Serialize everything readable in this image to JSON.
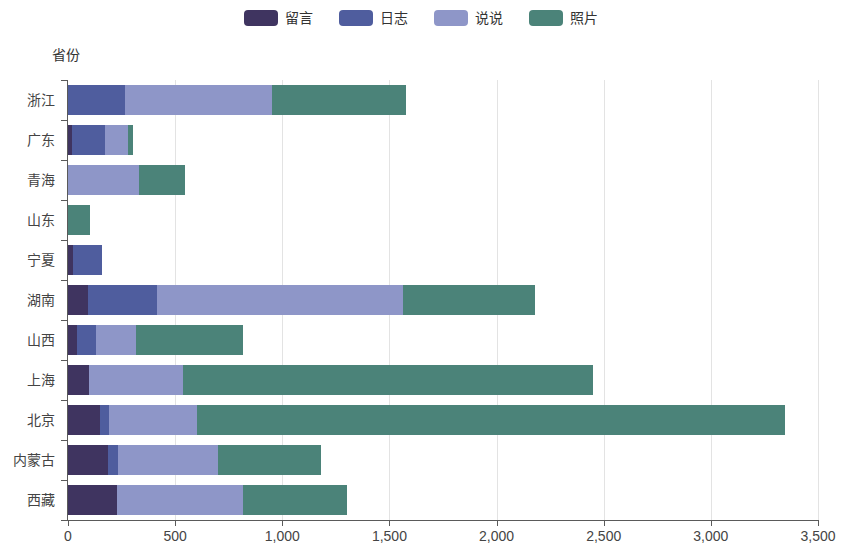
{
  "legend": {
    "position": "top-center",
    "items": [
      {
        "label": "留言",
        "color": "#3f3460",
        "key": "liuyan"
      },
      {
        "label": "日志",
        "color": "#4f5d9e",
        "key": "rizhi"
      },
      {
        "label": "说说",
        "color": "#8e96c8",
        "key": "shuoshuo"
      },
      {
        "label": "照片",
        "color": "#4b8379",
        "key": "zhaopian"
      }
    ]
  },
  "axis_title": "省份",
  "chart_data": {
    "type": "bar",
    "orientation": "horizontal",
    "stacked": true,
    "title": "",
    "subtitle": "",
    "xlabel": "",
    "ylabel": "省份",
    "xlim": [
      0,
      3500
    ],
    "ylim": null,
    "grid": true,
    "legend_position": "top-center",
    "xticks": [
      0,
      500,
      1000,
      1500,
      2000,
      2500,
      3000,
      3500
    ],
    "xticklabels": [
      "0",
      "500",
      "1,000",
      "1,500",
      "2,000",
      "2,500",
      "3,000",
      "3,500"
    ],
    "categories": [
      "浙江",
      "广东",
      "青海",
      "山东",
      "宁夏",
      "湖南",
      "山西",
      "上海",
      "北京",
      "内蒙古",
      "西藏"
    ],
    "series": [
      {
        "name": "留言",
        "color": "#3f3460",
        "values": [
          0,
          20,
          0,
          0,
          25,
          95,
          40,
          98,
          149,
          187,
          228
        ]
      },
      {
        "name": "日志",
        "color": "#4f5d9e",
        "values": [
          266,
          153,
          0,
          0,
          134,
          320,
          91,
          0,
          42,
          48,
          0
        ]
      },
      {
        "name": "说说",
        "color": "#8e96c8",
        "values": [
          686,
          107,
          331,
          0,
          0,
          1148,
          186,
          439,
          411,
          464,
          589
        ]
      },
      {
        "name": "照片",
        "color": "#4b8379",
        "values": [
          625,
          23,
          215,
          103,
          0,
          617,
          500,
          1913,
          2744,
          481,
          485
        ]
      }
    ],
    "totals": [
      1577,
      303,
      546,
      103,
      159,
      2180,
      817,
      2450,
      3346,
      1180,
      1302
    ]
  }
}
